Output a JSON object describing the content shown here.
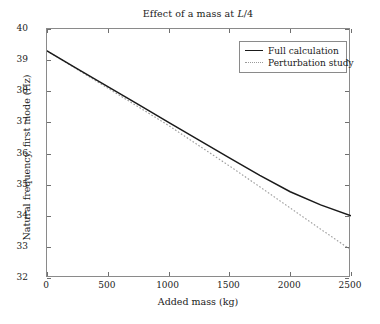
{
  "chart_data": {
    "type": "line",
    "title": "Effect of a mass at L/4",
    "title_parts": {
      "before": "Effect of a mass at ",
      "italic": "L",
      "after": "/4"
    },
    "xlabel": "Added mass (kg)",
    "ylabel": "Natural frequency, first mode (Hz)",
    "xlim": [
      0,
      2500
    ],
    "ylim": [
      32,
      40
    ],
    "xticks": [
      0,
      500,
      1000,
      1500,
      2000,
      2500
    ],
    "yticks": [
      32,
      33,
      34,
      35,
      36,
      37,
      38,
      39,
      40
    ],
    "grid": false,
    "legend_position": "upper right",
    "x": [
      0,
      250,
      500,
      750,
      1000,
      1250,
      1500,
      1750,
      2000,
      2250,
      2500
    ],
    "series": [
      {
        "name": "Full calculation",
        "style": "solid",
        "color": "#1a1a1a",
        "values": [
          39.3,
          38.72,
          38.15,
          37.58,
          37.0,
          36.43,
          35.86,
          35.3,
          34.77,
          34.35,
          34.0
        ]
      },
      {
        "name": "Perturbation study",
        "style": "dotted",
        "color": "#9a9a9a",
        "values": [
          39.3,
          38.7,
          38.1,
          37.5,
          36.9,
          36.25,
          35.6,
          34.93,
          34.25,
          33.57,
          32.9
        ]
      }
    ]
  },
  "legend": {
    "entries": [
      {
        "label": "Full calculation",
        "style": "solid"
      },
      {
        "label": "Perturbation study",
        "style": "dotted"
      }
    ]
  },
  "axes": {
    "x_tick_labels": [
      "0",
      "500",
      "1000",
      "1500",
      "2000",
      "2500"
    ],
    "y_tick_labels": [
      "32",
      "33",
      "34",
      "35",
      "36",
      "37",
      "38",
      "39",
      "40"
    ]
  },
  "style": {
    "background": "#ffffff",
    "frame_color": "#8a8a8a",
    "text_color": "#1a1a1a",
    "solid_series_color": "#1a1a1a",
    "dotted_series_color": "#9a9a9a"
  }
}
